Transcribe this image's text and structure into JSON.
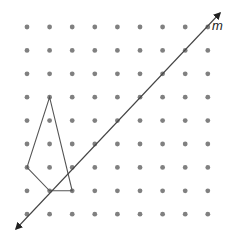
{
  "diagram": {
    "grid": {
      "cols": 9,
      "rows": 9,
      "x0": 27,
      "y0": 27,
      "dx": 22.6,
      "dy": 23.4,
      "dot_color": "#808080",
      "dot_radius": 2.4
    },
    "polygon": {
      "vertices_grid": [
        [
          1,
          3
        ],
        [
          0,
          6
        ],
        [
          1,
          7
        ],
        [
          2,
          7
        ]
      ],
      "stroke": "#555555"
    },
    "line_m": {
      "label": "m",
      "from": [
        16,
        229
      ],
      "to": [
        220,
        13
      ],
      "stroke": "#444444",
      "label_pos": [
        212,
        30
      ]
    }
  }
}
